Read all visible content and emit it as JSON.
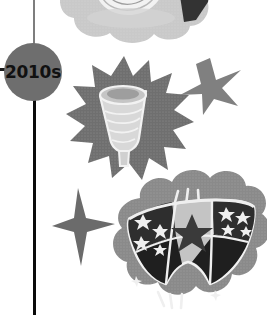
{
  "figure": {
    "background_color": "#ffffff",
    "width": 267,
    "height": 315,
    "style": "grayscale halftone illustration"
  },
  "timeline": {
    "axis_color_upper": "#7e7e7e",
    "axis_color_lower": "#0a0a0a",
    "tick_color": "#1a1a1a",
    "node": {
      "label": "2010s",
      "fill_color": "#6e6e6e",
      "text_color": "#111111"
    }
  },
  "illustrations": [
    {
      "name": "sanitary-pad-cloud",
      "caption": "Sanitary pad in cloud burst",
      "cloud_color": "#c9c9c9",
      "accent_color": "#3a3a3a",
      "highlight_color": "#efefef"
    },
    {
      "name": "menstrual-cup-starburst",
      "caption": "Menstrual cup in starburst",
      "burst_color": "#6f6f6f",
      "cup_color": "#d8d8d8",
      "outline_color": "#f2f2f2"
    },
    {
      "name": "period-underwear-cloud",
      "caption": "Period underwear with stars in cloud",
      "cloud_color": "#8a8a8a",
      "fabric_light_color": "#c4c4c4",
      "fabric_dark_color": "#2e2e2e",
      "star_color": "#efefef"
    }
  ],
  "decorations": [
    {
      "name": "five-point-star",
      "color": "#808080"
    },
    {
      "name": "four-point-sparkle",
      "color": "#6b6b6b"
    }
  ]
}
